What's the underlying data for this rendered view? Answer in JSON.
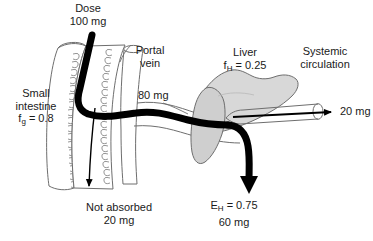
{
  "figure": {
    "type": "anatomical-flow-diagram",
    "width": 373,
    "height": 241,
    "background_color": "#ffffff"
  },
  "colors": {
    "drug_path": "#000000",
    "organ_fill": "#d8d8d8",
    "organ_fill_light": "#e8e8e8",
    "outline": "#6e6e6e",
    "villi": "#8a8a8a",
    "text": "#1a1a1a"
  },
  "labels": {
    "dose": {
      "line1": "Dose",
      "line2": "100 mg"
    },
    "small_intestine": {
      "line1": "Small",
      "line2": "intestine",
      "symbol": "f",
      "subscript": "g",
      "equals": " = 0.8"
    },
    "portal_vein": {
      "line1": "Portal",
      "line2": "vein"
    },
    "portal_amount": "80 mg",
    "liver": {
      "line1": "Liver",
      "symbol": "f",
      "subscript": "H",
      "equals": " = 0.25"
    },
    "systemic": {
      "line1": "Systemic",
      "line2": "circulation"
    },
    "systemic_amount": "20 mg",
    "not_absorbed": {
      "line1": "Not absorbed",
      "line2": "20 mg"
    },
    "hepatic_extraction": {
      "symbol": "E",
      "subscript": "H",
      "equals": " = 0.75",
      "line2": "60 mg"
    }
  },
  "flow_values": {
    "dose_mg": 100,
    "not_absorbed_mg": 20,
    "absorbed_portal_mg": 80,
    "hepatic_extracted_mg": 60,
    "systemic_mg": 20,
    "f_g": 0.8,
    "f_H": 0.25,
    "E_H": 0.75
  }
}
